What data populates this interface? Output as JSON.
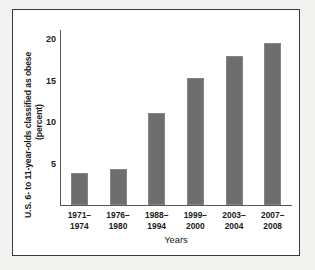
{
  "chart_data": {
    "type": "bar",
    "title": "",
    "xlabel": "Years",
    "ylabel": "U.S. 6- to 11-year-olds classified as obese (percent)",
    "ylabel_lines": [
      "U.S. 6- to 11-year-olds classified as obese",
      "(percent)"
    ],
    "categories": [
      "1971–\n1974",
      "1976–\n1980",
      "1988–\n1994",
      "1999–\n2000",
      "2003–\n2004",
      "2007–\n2008"
    ],
    "values": [
      3.9,
      4.3,
      11.1,
      15.3,
      18.0,
      19.5
    ],
    "ylim": [
      0,
      21
    ],
    "yticks": [
      5,
      10,
      15,
      20
    ],
    "ytick_labels": [
      "5",
      "10",
      "15",
      "20"
    ],
    "grid": false,
    "legend": false,
    "bar_color": "#6e6e6e",
    "axis_color": "#555555",
    "text_color": "#1a1a1a",
    "frame_color": "#3a3a3a",
    "background": "#ffffff"
  }
}
